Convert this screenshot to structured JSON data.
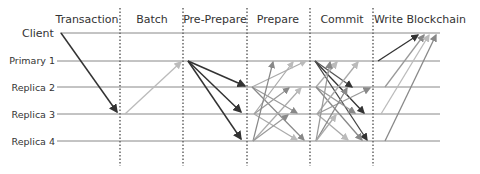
{
  "diagram": {
    "phases": [
      {
        "label": "Transaction",
        "x": 87
      },
      {
        "label": "Batch",
        "x": 152
      },
      {
        "label": "Pre-Prepare",
        "x": 215
      },
      {
        "label": "Prepare",
        "x": 278
      },
      {
        "label": "Commit",
        "x": 342
      },
      {
        "label": "Write Blockchain",
        "x": 418
      }
    ],
    "dividers_x": [
      120,
      183,
      247,
      310,
      373
    ],
    "nodes": [
      {
        "label": "Client",
        "y": 33
      },
      {
        "label": "Primary 1",
        "y": 61
      },
      {
        "label": "Replica 2",
        "y": 87
      },
      {
        "label": "Replica 3",
        "y": 114
      },
      {
        "label": "Replica 4",
        "y": 141
      }
    ],
    "colors": {
      "dark": "#333333",
      "medium": "#888888",
      "light": "#bbbbbb",
      "timeline": "#777777",
      "divider": "#666666"
    }
  }
}
